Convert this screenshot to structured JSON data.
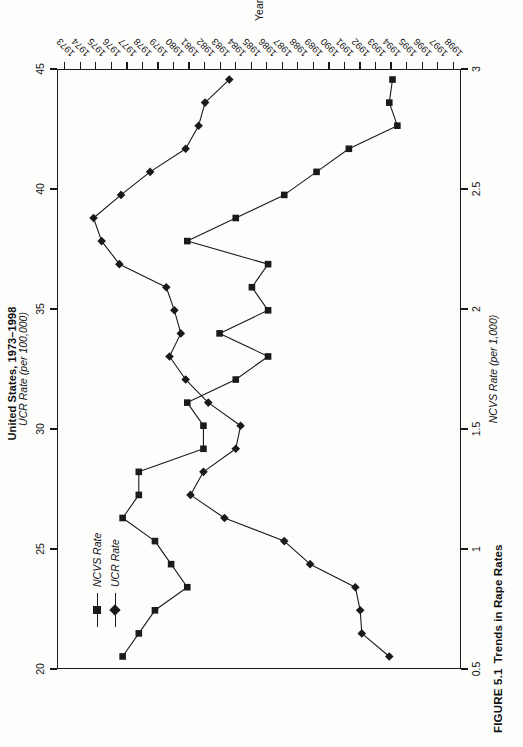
{
  "figure": {
    "caption_number": "FIGURE 5.1",
    "caption_text": "Trends in Rape Rates",
    "title": "United States, 1973–1998"
  },
  "legend": {
    "position": "inside-top-left",
    "items": [
      {
        "label": "NCVS Rate",
        "marker": "square",
        "color": "#1a1a1a"
      },
      {
        "label": "UCR Rate",
        "marker": "diamond",
        "color": "#1a1a1a"
      }
    ]
  },
  "axes": {
    "x": {
      "label": "Year",
      "ticks": [
        "1973",
        "1974",
        "1975",
        "1976",
        "1977",
        "1978",
        "1979",
        "1980",
        "1981",
        "1982",
        "1983",
        "1984",
        "1985",
        "1986",
        "1987",
        "1988",
        "1989",
        "1990",
        "1991",
        "1992",
        "1993",
        "1994",
        "1995",
        "1996",
        "1997",
        "1998"
      ]
    },
    "y_left": {
      "label": "NCVS Rate (per 1,000)",
      "ticks": [
        "0.5",
        "1",
        "1.5",
        "2",
        "2.5",
        "3"
      ],
      "min": 0.5,
      "max": 3
    },
    "y_right": {
      "label": "UCR Rate (per 100,000)",
      "ticks": [
        "20",
        "25",
        "30",
        "35",
        "40",
        "45"
      ],
      "min": 20,
      "max": 45
    }
  },
  "chart_data": {
    "type": "line",
    "title": "United States, 1973–1998",
    "subtitle": "FIGURE 5.1 Trends in Rape Rates",
    "xlabel": "Year",
    "ylabel": "NCVS Rate (per 1,000)",
    "y2label": "UCR Rate (per 100,000)",
    "grid": false,
    "legend_position": "upper left inside plot",
    "x": [
      1973,
      1974,
      1975,
      1976,
      1977,
      1978,
      1979,
      1980,
      1981,
      1982,
      1983,
      1984,
      1985,
      1986,
      1987,
      1988,
      1989,
      1990,
      1991,
      1992,
      1993,
      1994,
      1995,
      1996,
      1997,
      1998
    ],
    "ylim": [
      0.5,
      3
    ],
    "y2lim": [
      20,
      45
    ],
    "series": [
      {
        "name": "NCVS Rate",
        "axis": "left",
        "units": "per 1,000",
        "marker": "square",
        "values": [
          2.6,
          2.5,
          2.4,
          2.2,
          2.3,
          2.4,
          2.6,
          2.5,
          2.5,
          2.1,
          2.1,
          2.2,
          1.9,
          1.7,
          2.0,
          1.7,
          1.8,
          1.7,
          2.2,
          1.9,
          1.6,
          1.4,
          1.2,
          0.9,
          0.95,
          0.93
        ],
        "notes": "Squares, left axis; tracks high in the late 1970s and declines sharply after 1992"
      },
      {
        "name": "UCR Rate",
        "axis": "right",
        "units": "per 100,000",
        "marker": "diamond",
        "values": [
          24.5,
          26.2,
          26.3,
          26.6,
          29.4,
          31.0,
          34.7,
          36.8,
          36.0,
          34.0,
          33.7,
          35.7,
          37.1,
          38.1,
          37.4,
          37.8,
          38.3,
          41.2,
          42.3,
          42.8,
          41.1,
          39.3,
          37.1,
          36.3,
          35.9,
          34.4
        ],
        "notes": "Diamonds, right axis; rises through the 1980s, peaks 1991–1992, then declines"
      }
    ]
  }
}
